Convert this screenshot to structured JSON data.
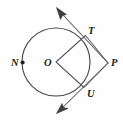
{
  "figure": {
    "background_color": "#fefefe",
    "stroke_color": "#4a4a4a",
    "label_color": "#1a1a1a",
    "width": 123,
    "height": 120
  },
  "circle": {
    "center_label": "O",
    "center_x": 56,
    "center_y": 62,
    "radius": 34
  },
  "points": [
    {
      "id": "N",
      "label": "N",
      "x": 22.6,
      "y": 62.5,
      "label_x": 11,
      "label_y": 66,
      "has_dot": true,
      "on_circle": true
    },
    {
      "id": "O",
      "label": "O",
      "x": 56,
      "y": 62,
      "label_x": 44,
      "label_y": 66,
      "has_dot": false,
      "on_circle": false
    },
    {
      "id": "T",
      "label": "T",
      "x": 85.5,
      "y": 35.5,
      "label_x": 88,
      "label_y": 34,
      "has_dot": false,
      "on_circle": true
    },
    {
      "id": "P",
      "label": "P",
      "x": 108,
      "y": 63,
      "label_x": 111,
      "label_y": 66,
      "has_dot": false,
      "on_circle": false
    },
    {
      "id": "U",
      "label": "U",
      "x": 84,
      "y": 87.5,
      "label_x": 87,
      "label_y": 97,
      "has_dot": false,
      "on_circle": true
    }
  ],
  "quadrilateral": {
    "name": "OTPU",
    "vertices": [
      "O",
      "T",
      "P",
      "U"
    ],
    "path": "M 56 62 L 85.5 35.5 L 108 63 L 84 87.5 Z"
  },
  "rays": [
    {
      "id": "ray-through-T",
      "from_point": "T",
      "through_point": "P",
      "direction": "upper-left",
      "line_path": "M 108 63 L 57.5 9",
      "arrow_tip_x": 56.5,
      "arrow_tip_y": 7.5,
      "arrow_points": "56.5,7.5 66.5,14.5 62.5,15.5 60.5,19.5"
    },
    {
      "id": "ray-through-U",
      "from_point": "U",
      "through_point": "P",
      "direction": "lower-left",
      "line_path": "M 108 63 L 58 112",
      "arrow_tip_x": 56.5,
      "arrow_tip_y": 113.5,
      "arrow_points": "56.5,113.5 62,103.5 63.5,107.5 68,108.5"
    }
  ],
  "labels": {
    "N": "N",
    "O": "O",
    "T": "T",
    "P": "P",
    "U": "U"
  }
}
